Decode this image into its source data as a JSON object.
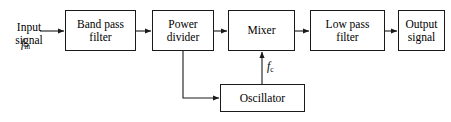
{
  "diagram": {
    "line_color": "#1a1a1a",
    "background_color": "#ffffff",
    "text_color": "#000000",
    "blocks": [
      {
        "id": "band-pass-filter",
        "label": "Band pass\nfilter",
        "x": 65,
        "y": 10,
        "w": 71,
        "h": 41
      },
      {
        "id": "power-divider",
        "label": "Power\ndivider",
        "x": 152,
        "y": 10,
        "w": 62,
        "h": 41
      },
      {
        "id": "mixer",
        "label": "Mixer",
        "x": 228,
        "y": 10,
        "w": 67,
        "h": 41
      },
      {
        "id": "low-pass-filter",
        "label": "Low pass\nfilter",
        "x": 310,
        "y": 10,
        "w": 75,
        "h": 41
      },
      {
        "id": "output-signal",
        "label": "Output\nsignal",
        "x": 398,
        "y": 10,
        "w": 47,
        "h": 41
      },
      {
        "id": "oscillator",
        "label": "Oscillator",
        "x": 220,
        "y": 84,
        "w": 85,
        "h": 28
      }
    ],
    "labels": {
      "input_signal": "Input\nsignal",
      "input_freq_symbol": "f",
      "input_freq_subscript": "in",
      "carrier_freq_symbol": "f",
      "carrier_freq_subscript": "c"
    },
    "connections": [
      {
        "id": "input-to-bandpass",
        "from": "input-signal-label",
        "to": "band-pass-filter",
        "arrow": true
      },
      {
        "id": "bandpass-to-divider",
        "from": "band-pass-filter",
        "to": "power-divider",
        "arrow": true
      },
      {
        "id": "divider-to-mixer",
        "from": "power-divider",
        "to": "mixer",
        "arrow": true
      },
      {
        "id": "mixer-to-lowpass",
        "from": "mixer",
        "to": "low-pass-filter",
        "arrow": true
      },
      {
        "id": "lowpass-to-output",
        "from": "low-pass-filter",
        "to": "output-signal",
        "arrow": true
      },
      {
        "id": "divider-to-oscillator",
        "from": "power-divider",
        "to": "oscillator",
        "arrow": true
      },
      {
        "id": "oscillator-to-mixer",
        "from": "oscillator",
        "to": "mixer",
        "arrow": true
      }
    ]
  }
}
